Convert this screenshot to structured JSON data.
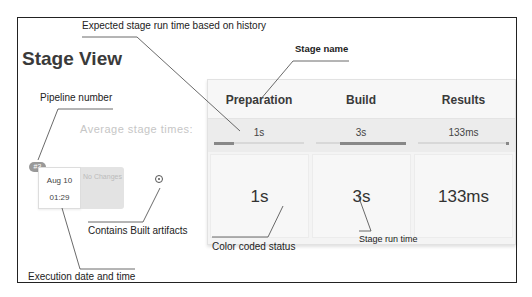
{
  "title": "Stage View",
  "callouts": {
    "expected_time": "Expected stage run time based on history",
    "stage_name": "Stage name",
    "pipeline_number": "Pipeline number",
    "contains_artifacts": "Contains Built artifacts",
    "color_coded_status": "Color coded status",
    "stage_run_time": "Stage run time",
    "execution_date_time": "Execution date and time"
  },
  "average_label": "Average stage times:",
  "stages": [
    {
      "name": "Preparation",
      "avg": "1s",
      "run": "1s"
    },
    {
      "name": "Build",
      "avg": "3s",
      "run": "3s"
    },
    {
      "name": "Results",
      "avg": "133ms",
      "run": "133ms"
    }
  ],
  "build": {
    "number": "#3",
    "date": "Aug 10",
    "time": "01:29",
    "changes": "No Changes",
    "artifact_icon": "artifact-icon"
  }
}
